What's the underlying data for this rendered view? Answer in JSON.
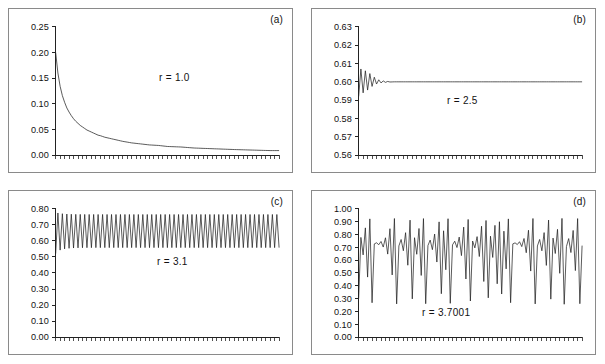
{
  "figure": {
    "background_color": "#ffffff",
    "frame_color": "#8a8a8a",
    "curve_color": "#222222",
    "panel_count": 4
  },
  "panels": [
    {
      "id": "a",
      "label": "(a)",
      "annotation": "r = 1.0",
      "yticks": [
        "0.00",
        "0.05",
        "0.10",
        "0.15",
        "0.20",
        "0.25"
      ]
    },
    {
      "id": "b",
      "label": "(b)",
      "annotation": "r = 2.5",
      "yticks": [
        "0.56",
        "0.57",
        "0.58",
        "0.59",
        "0.60",
        "0.61",
        "0.62",
        "0.63"
      ]
    },
    {
      "id": "c",
      "label": "(c)",
      "annotation": "r = 3.1",
      "yticks": [
        "0.00",
        "0.10",
        "0.20",
        "0.30",
        "0.40",
        "0.50",
        "0.60",
        "0.70",
        "0.80"
      ]
    },
    {
      "id": "d",
      "label": "(d)",
      "annotation": "r = 3.7001",
      "yticks": [
        "0.00",
        "0.10",
        "0.20",
        "0.30",
        "0.40",
        "0.50",
        "0.60",
        "0.70",
        "0.80",
        "0.90",
        "1.00"
      ]
    }
  ],
  "chart_data": [
    {
      "type": "line",
      "panel": "a",
      "title": "(a)",
      "annotation": "r = 1.0",
      "xlabel": "",
      "ylabel": "",
      "ylim": [
        0.0,
        0.25
      ],
      "yticks": [
        0.0,
        0.05,
        0.1,
        0.15,
        0.2,
        0.25
      ],
      "xlim": [
        0,
        100
      ],
      "x_tick_count": 50,
      "x_tick_labels": [],
      "grid": false,
      "legend": "none",
      "description": "Logistic map x(n+1)=r*x(n)*(1-x(n)) with r=1.0; orbit decays monotonically from about 0.20 toward 0.",
      "x": [
        0,
        1,
        2,
        3,
        4,
        5,
        6,
        7,
        8,
        9,
        10,
        11,
        12,
        13,
        14,
        15,
        16,
        17,
        18,
        19,
        20,
        22,
        24,
        26,
        28,
        30,
        34,
        38,
        42,
        46,
        50,
        56,
        62,
        68,
        74,
        80,
        88,
        96,
        100
      ],
      "y": [
        0.2,
        0.16,
        0.134,
        0.116,
        0.103,
        0.092,
        0.084,
        0.077,
        0.071,
        0.066,
        0.062,
        0.058,
        0.055,
        0.052,
        0.049,
        0.047,
        0.045,
        0.043,
        0.041,
        0.039,
        0.038,
        0.035,
        0.033,
        0.031,
        0.029,
        0.027,
        0.024,
        0.022,
        0.02,
        0.019,
        0.017,
        0.016,
        0.014,
        0.013,
        0.012,
        0.011,
        0.01,
        0.009,
        0.009
      ]
    },
    {
      "type": "line",
      "panel": "b",
      "title": "(b)",
      "annotation": "r = 2.5",
      "xlabel": "",
      "ylabel": "",
      "ylim": [
        0.56,
        0.63
      ],
      "yticks": [
        0.56,
        0.57,
        0.58,
        0.59,
        0.6,
        0.61,
        0.62,
        0.63
      ],
      "xlim": [
        0,
        100
      ],
      "x_tick_count": 50,
      "x_tick_labels": [],
      "grid": false,
      "legend": "none",
      "description": "Logistic map with r=2.5; a brief damped oscillation in the first iterations settles onto the fixed point 0.60.",
      "x": [
        0,
        1,
        2,
        3,
        4,
        5,
        6,
        7,
        8,
        9,
        10,
        11,
        12,
        13,
        14,
        16,
        20,
        30,
        50,
        80,
        100
      ],
      "y": [
        0.592,
        0.607,
        0.594,
        0.606,
        0.5955,
        0.6045,
        0.5975,
        0.6025,
        0.5988,
        0.6011,
        0.5994,
        0.6005,
        0.5997,
        0.6002,
        0.5999,
        0.6,
        0.6,
        0.6,
        0.6,
        0.6,
        0.6
      ]
    },
    {
      "type": "line",
      "panel": "c",
      "title": "(c)",
      "annotation": "r = 3.1",
      "xlabel": "",
      "ylabel": "",
      "ylim": [
        0.0,
        0.8
      ],
      "yticks": [
        0.0,
        0.1,
        0.2,
        0.3,
        0.4,
        0.5,
        0.6,
        0.7,
        0.8
      ],
      "xlim": [
        0,
        100
      ],
      "x_tick_count": 50,
      "x_tick_labels": [],
      "grid": false,
      "legend": "none",
      "description": "Logistic map with r=3.1; orbit settles into a period-2 cycle alternating between about 0.558 and 0.765 after a short transient starting near 0.52.",
      "period2_low": 0.558,
      "period2_high": 0.765,
      "transient_start": 0.52
    },
    {
      "type": "line",
      "panel": "d",
      "title": "(d)",
      "annotation": "r = 3.7001",
      "xlabel": "",
      "ylabel": "",
      "ylim": [
        0.0,
        1.0
      ],
      "yticks": [
        0.0,
        0.1,
        0.2,
        0.3,
        0.4,
        0.5,
        0.6,
        0.7,
        0.8,
        0.9,
        1.0
      ],
      "xlim": [
        0,
        100
      ],
      "x_tick_count": 50,
      "x_tick_labels": [],
      "grid": false,
      "legend": "none",
      "description": "Logistic map with r=3.7001; chaotic orbit fluctuating irregularly between about 0.24 and 0.93.",
      "chaos_min": 0.24,
      "chaos_max": 0.93,
      "seed_x0": 0.3
    }
  ]
}
